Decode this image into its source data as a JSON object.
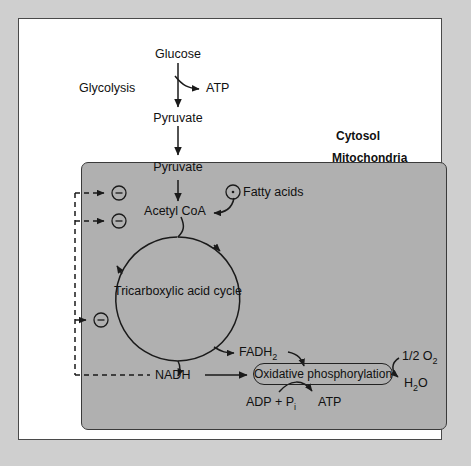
{
  "figure": {
    "compartments": {
      "cytosol_label": "Cytosol",
      "mitochondria_label": "Mitochondria"
    },
    "nodes": {
      "glucose": "Glucose",
      "glycolysis": "Glycolysis",
      "atp_glycolysis": "ATP",
      "pyruvate_cytosol": "Pyruvate",
      "pyruvate_mito": "Pyruvate",
      "acetyl_coa": "Acetyl CoA",
      "fatty_acids": "Fatty acids",
      "tca_cycle": "Tricarboxylic acid cycle",
      "fadh2_main": "FADH",
      "fadh2_sub": "2",
      "nadh": "NADH",
      "oxidative_phosphorylation": "Oxidative phosphorylation",
      "adp_pi_main": "ADP + P",
      "adp_pi_sub": "i",
      "atp_oxphos": "ATP",
      "half_o2_main": "1/2 O",
      "half_o2_sub": "2",
      "water_main": "H",
      "water_sub": "2",
      "water_tail": "O"
    },
    "regulation": {
      "symbol": "–",
      "meaning": "inhibition",
      "activation_symbol": "·",
      "inhibition_targets": [
        "pyruvate-to-acetyl-coa step",
        "acetyl-coa entry",
        "tricarboxylic acid cycle"
      ],
      "inhibition_source": "NADH",
      "activation_target": "fatty-acid-to-acetyl-coa step"
    },
    "colors": {
      "mat": "#cfcfcf",
      "card": "#ffffff",
      "mitochondria_fill": "#b0b0b0",
      "stroke": "#222222",
      "text": "#111111"
    }
  }
}
